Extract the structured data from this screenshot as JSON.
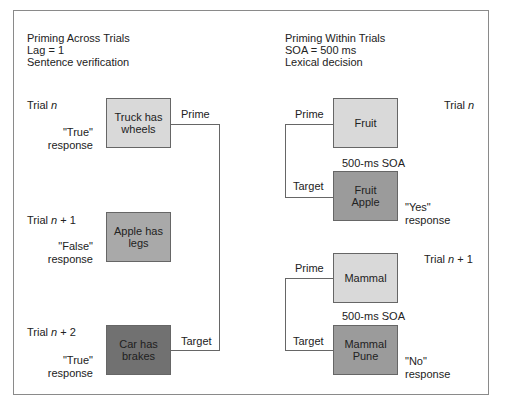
{
  "left_panel": {
    "title": "Priming Across Trials",
    "subtitle1": "Lag = 1",
    "subtitle2": "Sentence verification",
    "trials": [
      {
        "label_prefix": "Trial ",
        "label_var": "n",
        "label_suffix": "",
        "response_word": "\"True\"",
        "response_label": "response",
        "box_text_1": "Truck has",
        "box_text_2": "wheels",
        "connector": "Prime"
      },
      {
        "label_prefix": "Trial ",
        "label_var": "n",
        "label_suffix": " + 1",
        "response_word": "\"False\"",
        "response_label": "response",
        "box_text_1": "Apple has",
        "box_text_2": "legs"
      },
      {
        "label_prefix": "Trial ",
        "label_var": "n",
        "label_suffix": " + 2",
        "response_word": "\"True\"",
        "response_label": "response",
        "box_text_1": "Car has",
        "box_text_2": "brakes",
        "connector": "Target"
      }
    ]
  },
  "right_panel": {
    "title": "Priming Within Trials",
    "subtitle1": "SOA = 500 ms",
    "subtitle2": "Lexical decision",
    "trials": [
      {
        "label_prefix": "Trial ",
        "label_var": "n",
        "label_suffix": "",
        "prime_label": "Prime",
        "prime_text": "Fruit",
        "soa": "500-ms SOA",
        "target_label": "Target",
        "target_text_1": "Fruit",
        "target_text_2": "Apple",
        "response_word": "\"Yes\"",
        "response_label": "response"
      },
      {
        "label_prefix": "Trial ",
        "label_var": "n",
        "label_suffix": " + 1",
        "prime_label": "Prime",
        "prime_text": "Mammal",
        "soa": "500-ms SOA",
        "target_label": "Target",
        "target_text_1": "Mammal",
        "target_text_2": "Pune",
        "response_word": "\"No\"",
        "response_label": "response"
      }
    ]
  },
  "colors": {
    "light_box": "#d9d9d9",
    "mid_box": "#a9a9a9",
    "dark_box": "#717171",
    "border": "#666666"
  }
}
